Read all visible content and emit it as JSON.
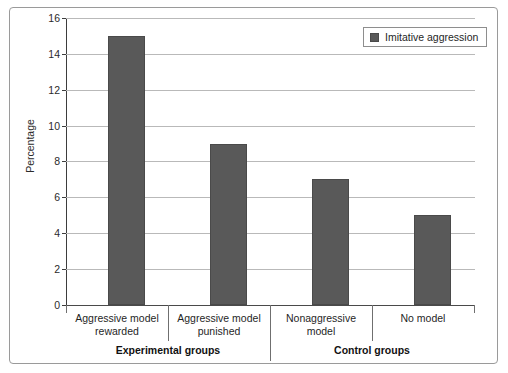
{
  "chart_data": {
    "type": "bar",
    "title": "",
    "xlabel": "",
    "ylabel": "Percentage",
    "ylim": [
      0,
      16
    ],
    "ytick_step": 2,
    "yticks": [
      0,
      2,
      4,
      6,
      8,
      10,
      12,
      14,
      16
    ],
    "ytick_labels": [
      "0",
      "2",
      "4",
      "6",
      "8",
      "10",
      "12",
      "14",
      "16"
    ],
    "grid": true,
    "legend_position": "top-right",
    "categories": [
      "Aggressive model rewarded",
      "Aggressive model punished",
      "Nonaggressive model",
      "No model"
    ],
    "category_lines": [
      [
        "Aggressive model",
        "rewarded"
      ],
      [
        "Aggressive model",
        "punished"
      ],
      [
        "Nonaggressive",
        "model"
      ],
      [
        "No model",
        ""
      ]
    ],
    "series": [
      {
        "name": "Imitative aggression",
        "values": [
          15,
          9,
          7,
          5
        ],
        "color": "#595959"
      }
    ],
    "groups": [
      {
        "label": "Experimental groups",
        "categories": [
          0,
          1
        ]
      },
      {
        "label": "Control groups",
        "categories": [
          2,
          3
        ]
      }
    ]
  },
  "legend": {
    "entries": [
      {
        "label": "Imitative aggression",
        "color": "#595959"
      }
    ]
  },
  "axes": {
    "y_label": "Percentage"
  },
  "colors": {
    "bar_fill": "#595959",
    "bar_stroke": "#4a4a4a",
    "gridline": "#b9b9b9",
    "axis": "#3d3d3d",
    "frame": "#9a9a9a",
    "text": "#1f1f1f",
    "background": "#ffffff"
  }
}
